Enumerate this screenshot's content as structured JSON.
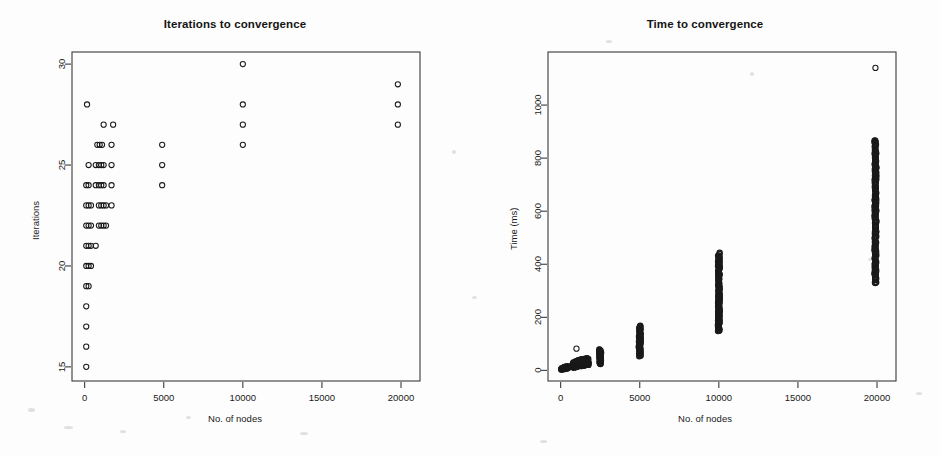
{
  "figure": {
    "background_color": "#fdfdfd",
    "point_color": "#1a1a1a",
    "axis_color": "#3a3a3a"
  },
  "chart_data": [
    {
      "type": "scatter",
      "panel": "left",
      "title": "Iterations to convergence",
      "xlabel": "No. of nodes",
      "ylabel": "Iterations",
      "xlim": [
        -800,
        21200
      ],
      "ylim": [
        14.3,
        30.6
      ],
      "xticks": [
        0,
        5000,
        10000,
        15000,
        20000
      ],
      "xtick_labels": [
        "0",
        "5000",
        "10000",
        "15000",
        "20000"
      ],
      "yticks": [
        15,
        20,
        25,
        30
      ],
      "ytick_labels": [
        "15",
        "20",
        "25",
        "30"
      ],
      "grid": false,
      "legend": "none",
      "marker": "open-circle",
      "points": [
        [
          100,
          15
        ],
        [
          100,
          16
        ],
        [
          100,
          17
        ],
        [
          100,
          18
        ],
        [
          100,
          19
        ],
        [
          250,
          19
        ],
        [
          100,
          20
        ],
        [
          250,
          20
        ],
        [
          400,
          20
        ],
        [
          100,
          21
        ],
        [
          250,
          21
        ],
        [
          400,
          21
        ],
        [
          700,
          21
        ],
        [
          100,
          22
        ],
        [
          250,
          22
        ],
        [
          400,
          22
        ],
        [
          900,
          22
        ],
        [
          1050,
          22
        ],
        [
          1200,
          22
        ],
        [
          1350,
          22
        ],
        [
          100,
          23
        ],
        [
          250,
          23
        ],
        [
          400,
          23
        ],
        [
          900,
          23
        ],
        [
          1050,
          23
        ],
        [
          1200,
          23
        ],
        [
          1350,
          23
        ],
        [
          1700,
          23
        ],
        [
          100,
          24
        ],
        [
          250,
          24
        ],
        [
          700,
          24
        ],
        [
          900,
          24
        ],
        [
          1050,
          24
        ],
        [
          1200,
          24
        ],
        [
          1700,
          24
        ],
        [
          4900,
          24
        ],
        [
          250,
          25
        ],
        [
          700,
          25
        ],
        [
          900,
          25
        ],
        [
          1050,
          25
        ],
        [
          1200,
          25
        ],
        [
          1700,
          25
        ],
        [
          4900,
          25
        ],
        [
          800,
          26
        ],
        [
          950,
          26
        ],
        [
          1100,
          26
        ],
        [
          1700,
          26
        ],
        [
          4900,
          26
        ],
        [
          10000,
          26
        ],
        [
          1200,
          27
        ],
        [
          1800,
          27
        ],
        [
          10000,
          27
        ],
        [
          19800,
          27
        ],
        [
          150,
          28
        ],
        [
          10000,
          28
        ],
        [
          19800,
          28
        ],
        [
          19800,
          29
        ],
        [
          10000,
          30
        ]
      ]
    },
    {
      "type": "scatter",
      "panel": "right",
      "title": "Time to convergence",
      "xlabel": "No. of nodes",
      "ylabel": "Time (ms)",
      "xlim": [
        -800,
        21200
      ],
      "ylim": [
        -40,
        1200
      ],
      "xticks": [
        0,
        5000,
        10000,
        15000,
        20000
      ],
      "xtick_labels": [
        "0",
        "5000",
        "10000",
        "15000",
        "20000"
      ],
      "yticks": [
        0,
        200,
        400,
        600,
        800,
        1000
      ],
      "ytick_labels": [
        "0",
        "200",
        "400",
        "600",
        "800",
        "1000"
      ],
      "grid": false,
      "legend": "none",
      "marker": "open-circle",
      "clusters": [
        {
          "x": 100,
          "y_min": 2,
          "y_max": 10,
          "n": 14,
          "dense": false
        },
        {
          "x": 250,
          "y_min": 4,
          "y_max": 14,
          "n": 14,
          "dense": false
        },
        {
          "x": 400,
          "y_min": 6,
          "y_max": 16,
          "n": 14,
          "dense": false
        },
        {
          "x": 800,
          "y_min": 10,
          "y_max": 30,
          "n": 26,
          "dense": true
        },
        {
          "x": 950,
          "y_min": 12,
          "y_max": 34,
          "n": 26,
          "dense": true
        },
        {
          "x": 1100,
          "y_min": 14,
          "y_max": 38,
          "n": 26,
          "dense": true
        },
        {
          "x": 1300,
          "y_min": 16,
          "y_max": 42,
          "n": 26,
          "dense": true
        },
        {
          "x": 1500,
          "y_min": 18,
          "y_max": 44,
          "n": 26,
          "dense": true
        },
        {
          "x": 1700,
          "y_min": 20,
          "y_max": 46,
          "n": 26,
          "dense": true
        },
        {
          "x": 2500,
          "y_min": 24,
          "y_max": 78,
          "n": 40,
          "dense": true
        },
        {
          "x": 5000,
          "y_min": 55,
          "y_max": 168,
          "n": 70,
          "dense": true
        },
        {
          "x": 10000,
          "y_min": 148,
          "y_max": 440,
          "n": 130,
          "dense": true
        },
        {
          "x": 19900,
          "y_min": 330,
          "y_max": 870,
          "n": 190,
          "dense": true
        }
      ],
      "outliers": [
        [
          1000,
          82
        ],
        [
          19900,
          1140
        ]
      ]
    }
  ]
}
